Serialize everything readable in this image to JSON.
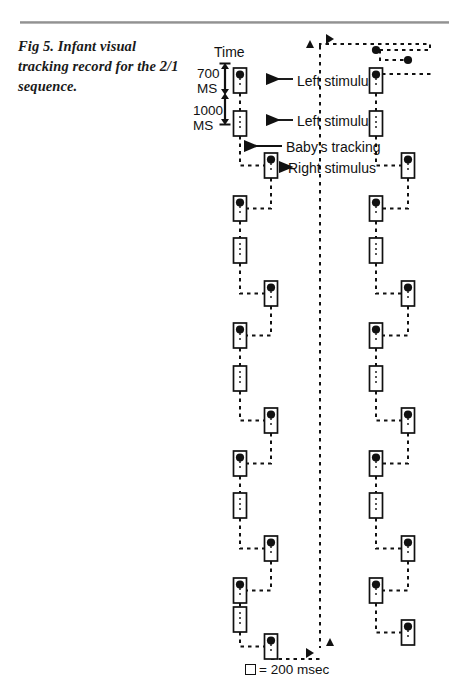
{
  "figure": {
    "caption": "Fig 5. Infant visual tracking record for the 2/1 sequence.",
    "time_axis_label": "Time",
    "scale": {
      "upper_value": "700",
      "upper_unit": "MS",
      "lower_value": "1000",
      "lower_unit": "MS"
    },
    "annotations": [
      {
        "id": "left-stimulus-1",
        "text": "Left stimulus"
      },
      {
        "id": "left-stimulus-2",
        "text": "Left stimulus"
      },
      {
        "id": "babys-tracking",
        "text": "Baby's tracking"
      },
      {
        "id": "right-stimulus",
        "text": "Right stimulus"
      }
    ],
    "legend": {
      "symbol": "square",
      "text": "= 200 msec"
    },
    "colors": {
      "ink": "#111111",
      "rule": "#8c8c8c",
      "paper": "#ffffff"
    }
  },
  "chart_data": {
    "type": "scatter",
    "title": "Fig 5. Infant visual tracking record for the 2/1 sequence.",
    "xlabel": "",
    "ylabel": "Time",
    "units": "milliseconds",
    "box_unit_msec": 200,
    "legend_entries": [
      "□ = 200 msec"
    ],
    "axis_markers": {
      "scale_segments": [
        {
          "label": "700 MS",
          "msec": 700
        },
        {
          "label": "1000 MS",
          "msec": 1000
        }
      ]
    },
    "columns": [
      {
        "name": "record-1-left",
        "x": 240
      },
      {
        "name": "record-1-right",
        "x": 271
      },
      {
        "name": "record-2-left",
        "x": 376
      },
      {
        "name": "record-2-right",
        "x": 408
      }
    ],
    "series": [
      {
        "name": "record-1",
        "events": [
          {
            "column": "record-1-left",
            "y": 68,
            "dot": true
          },
          {
            "column": "record-1-left",
            "y": 111,
            "dot": false
          },
          {
            "column": "record-1-right",
            "y": 153,
            "dot": true
          },
          {
            "column": "record-1-left",
            "y": 196,
            "dot": true
          },
          {
            "column": "record-1-left",
            "y": 238,
            "dot": false
          },
          {
            "column": "record-1-right",
            "y": 281,
            "dot": true
          },
          {
            "column": "record-1-left",
            "y": 323,
            "dot": true
          },
          {
            "column": "record-1-left",
            "y": 366,
            "dot": false
          },
          {
            "column": "record-1-right",
            "y": 408,
            "dot": true
          },
          {
            "column": "record-1-left",
            "y": 451,
            "dot": true
          },
          {
            "column": "record-1-left",
            "y": 493,
            "dot": false
          },
          {
            "column": "record-1-right",
            "y": 536,
            "dot": true
          },
          {
            "column": "record-1-left",
            "y": 578,
            "dot": true
          },
          {
            "column": "record-1-left",
            "y": 607,
            "dot": false
          },
          {
            "column": "record-1-right",
            "y": 634,
            "dot": true
          }
        ]
      },
      {
        "name": "record-2",
        "events": [
          {
            "column": "record-2-left",
            "y": 68,
            "dot": true
          },
          {
            "column": "record-2-left",
            "y": 111,
            "dot": false
          },
          {
            "column": "record-2-right",
            "y": 153,
            "dot": true
          },
          {
            "column": "record-2-left",
            "y": 196,
            "dot": true
          },
          {
            "column": "record-2-left",
            "y": 238,
            "dot": false
          },
          {
            "column": "record-2-right",
            "y": 281,
            "dot": true
          },
          {
            "column": "record-2-left",
            "y": 323,
            "dot": true
          },
          {
            "column": "record-2-left",
            "y": 366,
            "dot": false
          },
          {
            "column": "record-2-right",
            "y": 408,
            "dot": true
          },
          {
            "column": "record-2-left",
            "y": 451,
            "dot": true
          },
          {
            "column": "record-2-left",
            "y": 493,
            "dot": false
          },
          {
            "column": "record-2-right",
            "y": 536,
            "dot": true
          },
          {
            "column": "record-2-left",
            "y": 578,
            "dot": true
          },
          {
            "column": "record-2-right",
            "y": 620,
            "dot": true
          }
        ]
      }
    ]
  }
}
